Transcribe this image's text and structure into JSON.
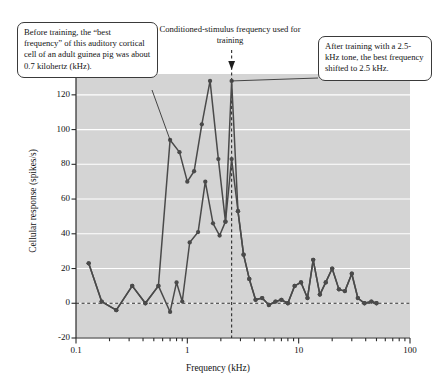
{
  "annotations": {
    "before": "Before training, the “best frequency” of this auditory cortical cell of an adult guinea pig was about 0.7 kilohertz (kHz).",
    "stimulus": "Conditioned-stimulus frequency used for training",
    "after": "After training with a 2.5-kHz tone, the best frequency shifted to 2.5 kHz."
  },
  "icons": {
    "stimulus_arrow": "arrow-down-icon"
  },
  "chart_data": {
    "type": "line",
    "title": "",
    "xlabel": "Frequency (kHz)",
    "ylabel": "Cellular response (spikes/s)",
    "xscale": "log",
    "xlim": [
      0.1,
      100
    ],
    "ylim": [
      -20,
      132
    ],
    "yticks": [
      -20,
      0,
      20,
      40,
      60,
      80,
      100,
      120
    ],
    "xticks": [
      0.1,
      1,
      10,
      100
    ],
    "xticklabels": [
      "0.1",
      "1",
      "10",
      "100"
    ],
    "grid": "horizontal-white",
    "legend": "none",
    "plot_bgcolor": "#d4d4d4",
    "line_color": "#4a4a4a",
    "marker_color": "#4a4a4a",
    "zero_reference_line": 0,
    "stimulus_frequency": 2.5,
    "series": [
      {
        "name": "Before training",
        "points": [
          [
            0.13,
            23
          ],
          [
            0.17,
            1
          ],
          [
            0.23,
            -4
          ],
          [
            0.32,
            10
          ],
          [
            0.42,
            0
          ],
          [
            0.55,
            10
          ],
          [
            0.7,
            -5
          ],
          [
            0.8,
            12
          ],
          [
            0.9,
            1
          ],
          [
            1.05,
            35
          ],
          [
            1.25,
            41
          ],
          [
            1.45,
            70
          ],
          [
            1.7,
            46
          ],
          [
            1.95,
            39
          ],
          [
            2.2,
            47
          ],
          [
            2.5,
            83
          ],
          [
            2.85,
            53
          ],
          [
            3.2,
            28
          ],
          [
            3.6,
            14
          ],
          [
            4.1,
            2
          ],
          [
            4.7,
            3
          ],
          [
            5.4,
            -1
          ],
          [
            6.2,
            1
          ],
          [
            7.0,
            2
          ],
          [
            8.0,
            0
          ],
          [
            9.2,
            10
          ],
          [
            10.5,
            12
          ],
          [
            12.0,
            3
          ],
          [
            13.5,
            25
          ],
          [
            15.5,
            5
          ],
          [
            17.5,
            12
          ],
          [
            20.0,
            20
          ],
          [
            23.0,
            8
          ],
          [
            26.0,
            7
          ],
          [
            30.0,
            17
          ],
          [
            34.0,
            3
          ],
          [
            39.0,
            0
          ],
          [
            45.0,
            1
          ],
          [
            50.0,
            0
          ]
        ]
      },
      {
        "name": "After training",
        "points": [
          [
            0.13,
            23
          ],
          [
            0.17,
            1
          ],
          [
            0.23,
            -4
          ],
          [
            0.32,
            10
          ],
          [
            0.42,
            0
          ],
          [
            0.55,
            10
          ],
          [
            0.7,
            94
          ],
          [
            0.85,
            87
          ],
          [
            1.0,
            70
          ],
          [
            1.15,
            76
          ],
          [
            1.35,
            103
          ],
          [
            1.6,
            128
          ],
          [
            1.9,
            83
          ],
          [
            2.2,
            47
          ],
          [
            2.5,
            128
          ],
          [
            2.85,
            53
          ],
          [
            3.2,
            28
          ],
          [
            3.6,
            14
          ],
          [
            4.1,
            2
          ],
          [
            4.7,
            3
          ],
          [
            5.4,
            -1
          ],
          [
            6.2,
            1
          ],
          [
            7.0,
            2
          ],
          [
            8.0,
            0
          ],
          [
            9.2,
            10
          ],
          [
            10.5,
            12
          ],
          [
            12.0,
            3
          ],
          [
            13.5,
            25
          ],
          [
            15.5,
            5
          ],
          [
            17.5,
            12
          ],
          [
            20.0,
            20
          ],
          [
            23.0,
            8
          ],
          [
            26.0,
            7
          ],
          [
            30.0,
            17
          ],
          [
            34.0,
            3
          ],
          [
            39.0,
            0
          ],
          [
            45.0,
            1
          ],
          [
            50.0,
            0
          ]
        ]
      }
    ]
  }
}
